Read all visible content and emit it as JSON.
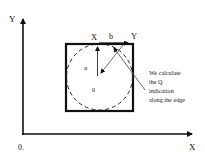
{
  "axes": {
    "y_label": "Y",
    "x_label": "X",
    "origin_label": "0."
  },
  "square": {
    "top_left_label": "X",
    "top_right_label": "Y",
    "edge_label": "b"
  },
  "circle": {
    "center_label": "0",
    "radius_label": "a"
  },
  "annotation": {
    "lines": [
      "We calculate",
      "the Q",
      "indication",
      "along the edge"
    ]
  },
  "colors": {
    "stroke": "#111111",
    "arrow_gray": "#555555"
  }
}
